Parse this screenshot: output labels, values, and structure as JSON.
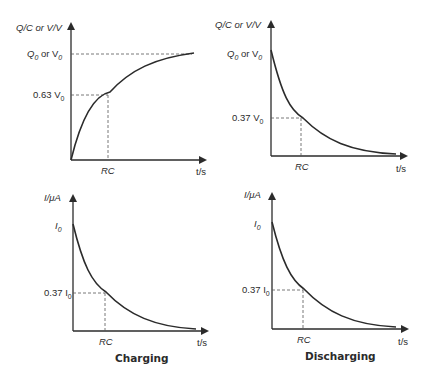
{
  "top_cut_text": "the voltage p… … … p… … …",
  "panels": [
    {
      "id": "charge-top",
      "y_label": "Q/C or V/V",
      "x_label": "t/s",
      "y_max_label_main": "Q",
      "y_max_label_sub": "0",
      "y_max_label_mid": " or V",
      "y_max_label_sub2": "0",
      "y_mark_label": "0.63 V",
      "y_mark_sub": "0",
      "x_mark_label": "RC"
    },
    {
      "id": "discharge-top",
      "y_label": "Q/C or V/V",
      "x_label": "t/s",
      "y_max_label_main": "Q",
      "y_max_label_sub": "0",
      "y_max_label_mid": " or V",
      "y_max_label_sub2": "0",
      "y_mark_label": "0.37 V",
      "y_mark_sub": "0",
      "x_mark_label": "RC"
    },
    {
      "id": "charge-current",
      "y_label": "I/μA",
      "x_label": "t/s",
      "y_max_label_main": "I",
      "y_max_label_sub": "0",
      "y_mark_label": "0.37 I",
      "y_mark_sub": "0",
      "x_mark_label": "RC",
      "caption": "Charging"
    },
    {
      "id": "discharge-current",
      "y_label": "I/μA",
      "x_label": "t/s",
      "y_max_label_main": "I",
      "y_max_label_sub": "0",
      "y_mark_label": "0.37 I",
      "y_mark_sub": "0",
      "x_mark_label": "RC",
      "caption": "Discharging"
    }
  ],
  "colors": {
    "line": "#2b2b2b",
    "dashed": "#555555",
    "background": "#ffffff"
  }
}
